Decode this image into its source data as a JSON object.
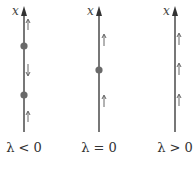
{
  "diagram": {
    "type": "phase-line bifurcation diagram",
    "axis_label": "x",
    "colors": {
      "line": "#555555",
      "dot": "#6a6a6a",
      "text": "#333333"
    },
    "panels": [
      {
        "label": "λ < 0",
        "line_x": 24,
        "fixed_points": [
          {
            "y": 46
          },
          {
            "y": 95
          }
        ],
        "flow_arrows": [
          {
            "y": 22,
            "dir": "up"
          },
          {
            "y": 70,
            "dir": "down"
          },
          {
            "y": 117,
            "dir": "up"
          }
        ]
      },
      {
        "label": "λ = 0",
        "line_x": 99,
        "fixed_points": [
          {
            "y": 70
          }
        ],
        "flow_arrows": [
          {
            "y": 40,
            "dir": "up"
          },
          {
            "y": 100,
            "dir": "up"
          }
        ]
      },
      {
        "label": "λ > 0",
        "line_x": 175,
        "fixed_points": [],
        "flow_arrows": [
          {
            "y": 40,
            "dir": "up"
          },
          {
            "y": 67,
            "dir": "up"
          },
          {
            "y": 98,
            "dir": "up"
          }
        ]
      }
    ]
  }
}
